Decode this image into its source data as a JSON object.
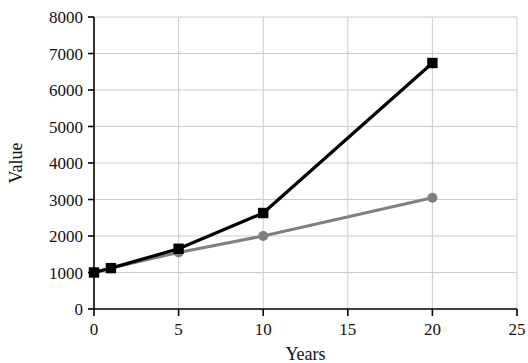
{
  "chart_data": {
    "type": "line",
    "title": "",
    "xlabel": "Years",
    "ylabel": "Value",
    "xlim": [
      0,
      25
    ],
    "ylim": [
      0,
      8000
    ],
    "xticks": [
      0,
      5,
      10,
      15,
      20,
      25
    ],
    "yticks": [
      0,
      1000,
      2000,
      3000,
      4000,
      5000,
      6000,
      7000,
      8000
    ],
    "xtick_labels": [
      "0",
      "5",
      "10",
      "15",
      "20",
      "25"
    ],
    "ytick_labels": [
      "0",
      "1000",
      "2000",
      "3000",
      "4000",
      "5000",
      "6000",
      "7000",
      "8000"
    ],
    "grid": true,
    "grid_color": "#cccccc",
    "legend": null,
    "series": [
      {
        "name": "black-series",
        "color": "#000000",
        "marker": "square",
        "x": [
          0,
          1,
          5,
          10,
          20
        ],
        "values": [
          1000,
          1120,
          1650,
          2630,
          6740
        ]
      },
      {
        "name": "gray-series",
        "color": "#808080",
        "marker": "circle",
        "x": [
          0,
          1,
          5,
          10,
          20
        ],
        "values": [
          1000,
          1120,
          1550,
          2000,
          3050
        ]
      }
    ]
  },
  "axes": {
    "y_title": "Value",
    "x_title": "Years"
  }
}
